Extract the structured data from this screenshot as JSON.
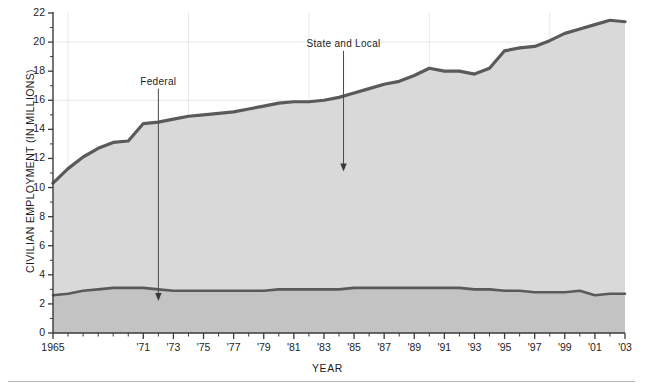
{
  "figure": {
    "bottom_rule": true
  },
  "axes": {
    "y_title": "CIVILIAN EMPLOYMENT (IN MILLIONS)",
    "x_title": "YEAR"
  },
  "annotations": [
    {
      "name": "federal",
      "label": "Federal",
      "x_year": 1972,
      "label_value": 16.8,
      "arrow_to_value": 2.2
    },
    {
      "name": "state-and-local",
      "label": "State and Local",
      "x_year": 1984.3,
      "label_value": 19.4,
      "arrow_to_value": 11.1
    }
  ],
  "colors": {
    "line": "#5a5a5a",
    "fill_state_local": "#d9d9d9",
    "fill_federal": "#c3c3c3",
    "grid": "#e8e8e8",
    "axis": "#3a3a3a",
    "text": "#1d1d1d",
    "rule": "#b9b9bd"
  },
  "chart_data": {
    "type": "area",
    "title": "",
    "xlabel": "YEAR",
    "ylabel": "CIVILIAN EMPLOYMENT (IN MILLIONS)",
    "xlim": [
      1965,
      2003
    ],
    "ylim": [
      0,
      22
    ],
    "ytick_step": 2,
    "yticks": [
      0,
      2,
      4,
      6,
      8,
      10,
      12,
      14,
      16,
      18,
      20,
      22
    ],
    "ytick_labels": [
      "0",
      "2",
      "4",
      "6",
      "8",
      "10",
      "12",
      "14",
      "16",
      "18",
      "20",
      "22"
    ],
    "xticks": [
      1965,
      1966,
      1967,
      1968,
      1969,
      1970,
      1971,
      1972,
      1973,
      1974,
      1975,
      1976,
      1977,
      1978,
      1979,
      1980,
      1981,
      1982,
      1983,
      1984,
      1985,
      1986,
      1987,
      1988,
      1989,
      1990,
      1991,
      1992,
      1993,
      1994,
      1995,
      1996,
      1997,
      1998,
      1999,
      2000,
      2001,
      2002,
      2003
    ],
    "xtick_labels_shown": [
      "1965",
      "'71",
      "'73",
      "'75",
      "'77",
      "'79",
      "'81",
      "'83",
      "'85",
      "'87",
      "'89",
      "'91",
      "'93",
      "'95",
      "'97",
      "'99",
      "'01",
      "'03"
    ],
    "xtick_label_years": [
      1965,
      1971,
      1973,
      1975,
      1977,
      1979,
      1981,
      1983,
      1985,
      1987,
      1989,
      1991,
      1993,
      1995,
      1997,
      1999,
      2001,
      2003
    ],
    "grid": "major-only-light",
    "gridlines_x": [
      1966,
      1974,
      1982,
      1990,
      1998
    ],
    "gridlines_y": [
      16,
      20
    ],
    "legend": "annotated-arrows",
    "stacked": true,
    "x": [
      1965,
      1966,
      1967,
      1968,
      1969,
      1970,
      1971,
      1972,
      1973,
      1974,
      1975,
      1976,
      1977,
      1978,
      1979,
      1980,
      1981,
      1982,
      1983,
      1984,
      1985,
      1986,
      1987,
      1988,
      1989,
      1990,
      1991,
      1992,
      1993,
      1994,
      1995,
      1996,
      1997,
      1998,
      1999,
      2000,
      2001,
      2002,
      2003
    ],
    "series": [
      {
        "name": "Federal",
        "values": [
          2.6,
          2.7,
          2.9,
          3.0,
          3.1,
          3.1,
          3.1,
          3.0,
          2.9,
          2.9,
          2.9,
          2.9,
          2.9,
          2.9,
          2.9,
          3.0,
          3.0,
          3.0,
          3.0,
          3.0,
          3.1,
          3.1,
          3.1,
          3.1,
          3.1,
          3.1,
          3.1,
          3.1,
          3.0,
          3.0,
          2.9,
          2.9,
          2.8,
          2.8,
          2.8,
          2.9,
          2.6,
          2.7,
          2.7
        ]
      },
      {
        "name": "State and Local",
        "values": [
          7.7,
          8.6,
          9.2,
          9.7,
          10.0,
          10.1,
          11.3,
          11.5,
          11.8,
          12.0,
          12.1,
          12.2,
          12.3,
          12.5,
          12.7,
          12.8,
          12.9,
          12.9,
          13.0,
          13.2,
          13.4,
          13.7,
          14.0,
          14.2,
          14.6,
          15.1,
          14.9,
          14.9,
          14.8,
          15.2,
          16.5,
          16.7,
          16.9,
          17.3,
          17.8,
          18.0,
          18.6,
          18.8,
          18.7
        ]
      }
    ],
    "total_series": {
      "name": "Total civilian government employment",
      "values": [
        10.3,
        11.3,
        12.1,
        12.7,
        13.1,
        13.2,
        14.4,
        14.5,
        14.7,
        14.9,
        15.0,
        15.1,
        15.2,
        15.4,
        15.6,
        15.8,
        15.9,
        15.9,
        16.0,
        16.2,
        16.5,
        16.8,
        17.1,
        17.3,
        17.7,
        18.2,
        18.0,
        18.0,
        17.8,
        18.2,
        19.4,
        19.6,
        19.7,
        20.1,
        20.6,
        20.9,
        21.2,
        21.5,
        21.4
      ]
    }
  }
}
